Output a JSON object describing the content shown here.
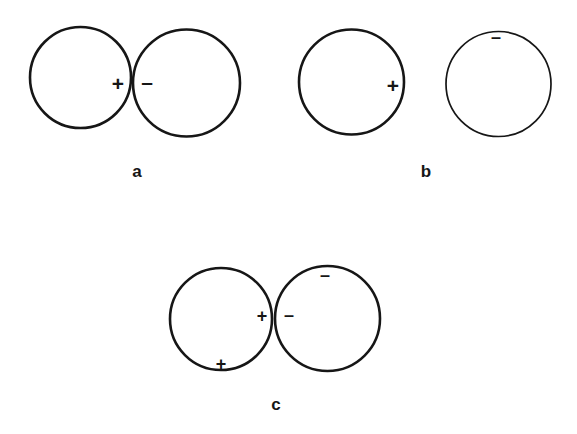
{
  "figure": {
    "type": "scientific-diagram",
    "background_color": "#ffffff",
    "stroke_color": "#161616"
  },
  "symbols": {
    "plus": "+",
    "minus": "–"
  },
  "panels": [
    {
      "id": "a",
      "label": "a",
      "label_x": 137,
      "label_y": 172,
      "circles": [
        {
          "name": "panel-a-left-circle",
          "cx": 80.5,
          "cy": 77.5,
          "r": 50.5,
          "stroke_width": 2.6
        },
        {
          "name": "panel-a-right-circle",
          "cx": 186.5,
          "cy": 83.0,
          "r": 53.5,
          "stroke_width": 2.6
        }
      ],
      "charges": [
        {
          "name": "panel-a-plus-charge",
          "sign": "+",
          "x": 118,
          "y": 84,
          "size": "normal"
        },
        {
          "name": "panel-a-minus-charge",
          "sign": "–",
          "x": 147,
          "y": 82,
          "size": "normal"
        }
      ]
    },
    {
      "id": "b",
      "label": "b",
      "label_x": 426,
      "label_y": 172,
      "circles": [
        {
          "name": "panel-b-left-circle",
          "cx": 351.5,
          "cy": 82.0,
          "r": 52.5,
          "stroke_width": 2.6
        },
        {
          "name": "panel-b-right-circle",
          "cx": 498.5,
          "cy": 84.0,
          "r": 52.5,
          "stroke_width": 1.7
        }
      ],
      "charges": [
        {
          "name": "panel-b-plus-charge",
          "sign": "+",
          "x": 393,
          "y": 86,
          "size": "normal"
        },
        {
          "name": "panel-b-minus-charge",
          "sign": "–",
          "x": 496,
          "y": 39,
          "size": "small"
        }
      ]
    },
    {
      "id": "c",
      "label": "c",
      "label_x": 276,
      "label_y": 405,
      "circles": [
        {
          "name": "panel-c-left-circle",
          "cx": 221.0,
          "cy": 319.0,
          "r": 51.0,
          "stroke_width": 2.6
        },
        {
          "name": "panel-c-right-circle",
          "cx": 327.5,
          "cy": 318.5,
          "r": 52.5,
          "stroke_width": 2.6
        }
      ],
      "charges": [
        {
          "name": "panel-c-contact-plus-charge",
          "sign": "+",
          "x": 262,
          "y": 318,
          "size": "small"
        },
        {
          "name": "panel-c-contact-minus-charge",
          "sign": "–",
          "x": 289,
          "y": 317,
          "size": "small"
        },
        {
          "name": "panel-c-lower-plus-charge",
          "sign": "+",
          "x": 221,
          "y": 366,
          "size": "small"
        },
        {
          "name": "panel-c-upper-minus-charge",
          "sign": "–",
          "x": 325,
          "y": 277,
          "size": "small"
        }
      ]
    }
  ]
}
